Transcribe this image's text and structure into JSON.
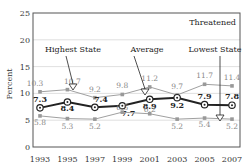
{
  "chart_data": {
    "type": "line",
    "title": "Threatened",
    "xlabel": "",
    "ylabel": "Percent",
    "ylim": [
      0,
      25
    ],
    "yticks": [
      0,
      5,
      10,
      15,
      20,
      25
    ],
    "x": [
      1993,
      1995,
      1997,
      1999,
      2001,
      2003,
      2005,
      2007
    ],
    "xtick_labels": [
      "1993",
      "1995",
      "1997",
      "1999",
      "2001",
      "2003",
      "2005",
      "2007"
    ],
    "grid": "horizontal",
    "series": [
      {
        "name": "Highest State",
        "values": [
          10.3,
          10.7,
          9.2,
          9.8,
          11.2,
          9.7,
          11.7,
          11.4
        ],
        "color": "#a0a0a0",
        "style": "thin-square-markers"
      },
      {
        "name": "Average",
        "values": [
          7.3,
          8.4,
          7.4,
          7.7,
          8.9,
          9.2,
          7.9,
          7.8
        ],
        "color": "#222222",
        "style": "thick-circle-markers"
      },
      {
        "name": "Lowest State",
        "values": [
          5.8,
          5.3,
          5.2,
          6.5,
          6.2,
          5.2,
          5.4,
          5.2
        ],
        "color": "#a0a0a0",
        "style": "thin-square-markers"
      }
    ],
    "annotations": [
      {
        "text": "Highest State",
        "points_to": {
          "x": 1994,
          "y": 10.5
        }
      },
      {
        "text": "Average",
        "points_to": {
          "x": 2000,
          "y": 8.3
        }
      },
      {
        "text": "Lowest State",
        "points_to": {
          "x": 2006,
          "y": 5.3
        }
      }
    ]
  }
}
